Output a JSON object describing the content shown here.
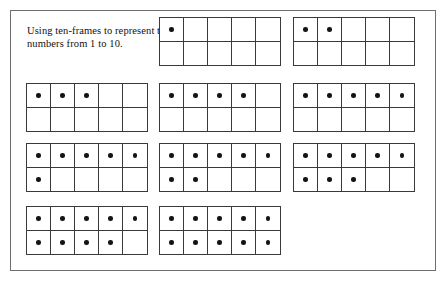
{
  "page": {
    "caption": "Using ten-frames to represent the numbers from 1 to 10.",
    "border_color": "#6e6e6e",
    "background_color": "#ffffff",
    "grid_line_color": "#3a3a3a",
    "dot_color": "#141414"
  },
  "frames": [
    {
      "id": "ten-frame-1",
      "number": 1,
      "slot": "r1c2",
      "top_row": [
        1,
        0,
        0,
        0,
        0
      ],
      "bottom_row": [
        0,
        0,
        0,
        0,
        0
      ]
    },
    {
      "id": "ten-frame-2",
      "number": 2,
      "slot": "r1c3",
      "top_row": [
        1,
        1,
        0,
        0,
        0
      ],
      "bottom_row": [
        0,
        0,
        0,
        0,
        0
      ]
    },
    {
      "id": "ten-frame-3",
      "number": 3,
      "slot": "r2c1",
      "top_row": [
        1,
        1,
        1,
        0,
        0
      ],
      "bottom_row": [
        0,
        0,
        0,
        0,
        0
      ]
    },
    {
      "id": "ten-frame-4",
      "number": 4,
      "slot": "r2c2",
      "top_row": [
        1,
        1,
        1,
        1,
        0
      ],
      "bottom_row": [
        0,
        0,
        0,
        0,
        0
      ]
    },
    {
      "id": "ten-frame-5",
      "number": 5,
      "slot": "r2c3",
      "top_row": [
        1,
        1,
        1,
        1,
        1
      ],
      "bottom_row": [
        0,
        0,
        0,
        0,
        0
      ]
    },
    {
      "id": "ten-frame-6",
      "number": 6,
      "slot": "r3c1",
      "top_row": [
        1,
        1,
        1,
        1,
        1
      ],
      "bottom_row": [
        1,
        0,
        0,
        0,
        0
      ]
    },
    {
      "id": "ten-frame-7",
      "number": 7,
      "slot": "r3c2",
      "top_row": [
        1,
        1,
        1,
        1,
        1
      ],
      "bottom_row": [
        1,
        1,
        0,
        0,
        0
      ]
    },
    {
      "id": "ten-frame-8",
      "number": 8,
      "slot": "r3c3",
      "top_row": [
        1,
        1,
        1,
        1,
        1
      ],
      "bottom_row": [
        1,
        1,
        1,
        0,
        0
      ]
    },
    {
      "id": "ten-frame-9",
      "number": 9,
      "slot": "r4c1",
      "top_row": [
        1,
        1,
        1,
        1,
        1
      ],
      "bottom_row": [
        1,
        1,
        1,
        1,
        0
      ]
    },
    {
      "id": "ten-frame-10",
      "number": 10,
      "slot": "r4c2",
      "top_row": [
        1,
        1,
        1,
        1,
        1
      ],
      "bottom_row": [
        1,
        1,
        1,
        1,
        1
      ]
    }
  ]
}
